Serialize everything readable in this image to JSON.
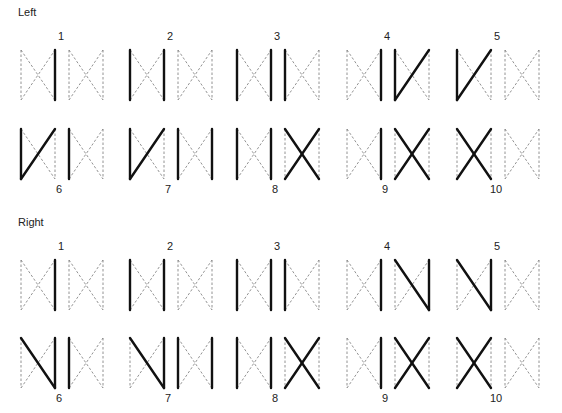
{
  "sections": [
    {
      "title": "Left",
      "diagonal_style": "up",
      "figures": [
        {
          "label": "1",
          "a": [
            "R"
          ],
          "b": []
        },
        {
          "label": "2",
          "a": [
            "L",
            "R"
          ],
          "b": []
        },
        {
          "label": "3",
          "a": [
            "L",
            "R"
          ],
          "b": [
            "L"
          ]
        },
        {
          "label": "4",
          "a": [
            "R"
          ],
          "b": [
            "L",
            "UP"
          ]
        },
        {
          "label": "5",
          "a": [
            "L",
            "UP"
          ],
          "b": []
        },
        {
          "label": "6",
          "a": [
            "L",
            "UP"
          ],
          "b": [
            "L"
          ]
        },
        {
          "label": "7",
          "a": [
            "L",
            "UP"
          ],
          "b": [
            "L",
            "R"
          ]
        },
        {
          "label": "8",
          "a": [
            "L",
            "R"
          ],
          "b": [
            "UP",
            "DOWN"
          ]
        },
        {
          "label": "9",
          "a": [
            "R"
          ],
          "b": [
            "UP",
            "DOWN"
          ]
        },
        {
          "label": "10",
          "a": [
            "UP",
            "DOWN"
          ],
          "b": []
        }
      ]
    },
    {
      "title": "Right",
      "diagonal_style": "down",
      "figures": [
        {
          "label": "1",
          "a": [
            "R"
          ],
          "b": []
        },
        {
          "label": "2",
          "a": [
            "L",
            "R"
          ],
          "b": []
        },
        {
          "label": "3",
          "a": [
            "L",
            "R"
          ],
          "b": [
            "L"
          ]
        },
        {
          "label": "4",
          "a": [
            "R"
          ],
          "b": [
            "R",
            "DOWN"
          ]
        },
        {
          "label": "5",
          "a": [
            "R",
            "DOWN"
          ],
          "b": []
        },
        {
          "label": "6",
          "a": [
            "R",
            "DOWN"
          ],
          "b": [
            "L"
          ]
        },
        {
          "label": "7",
          "a": [
            "R",
            "DOWN"
          ],
          "b": [
            "L",
            "R"
          ]
        },
        {
          "label": "8",
          "a": [
            "L",
            "R"
          ],
          "b": [
            "UP",
            "DOWN"
          ]
        },
        {
          "label": "9",
          "a": [
            "R"
          ],
          "b": [
            "UP",
            "DOWN"
          ]
        },
        {
          "label": "10",
          "a": [
            "UP",
            "DOWN"
          ],
          "b": []
        }
      ]
    }
  ],
  "style": {
    "solid_color": "#111111",
    "dashed_color": "#777777",
    "solid_width": 2.4,
    "dashed_width": 0.8
  }
}
